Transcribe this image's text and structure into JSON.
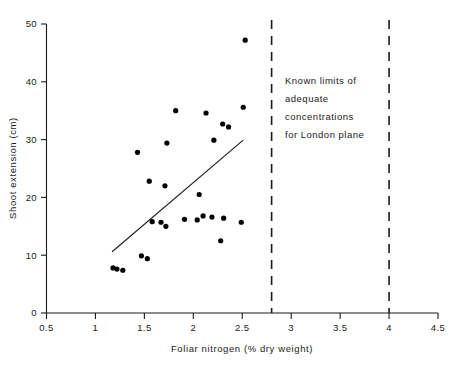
{
  "chart_data": {
    "type": "scatter",
    "title": "",
    "xlabel": "Foliar nitrogen (% dry weight)",
    "ylabel": "Shoot extension (cm)",
    "xlim": [
      0.5,
      4.5
    ],
    "ylim": [
      0,
      50
    ],
    "xticks": [
      "0.5",
      "1",
      "1.5",
      "2",
      "2.5",
      "3",
      "3.5",
      "4",
      "4.5"
    ],
    "xtick_values": [
      0.5,
      1,
      1.5,
      2,
      2.5,
      3,
      3.5,
      4,
      4.5
    ],
    "yticks": [
      "0",
      "10",
      "20",
      "30",
      "40",
      "50"
    ],
    "ytick_values": [
      0,
      10,
      20,
      30,
      40,
      50
    ],
    "grid": false,
    "legend": "none",
    "series": [
      {
        "name": "Shoot extension vs foliar nitrogen",
        "marker": "filled-circle",
        "color": "#000000",
        "points": [
          {
            "x": 1.18,
            "y": 7.8
          },
          {
            "x": 1.22,
            "y": 7.6
          },
          {
            "x": 1.28,
            "y": 7.4
          },
          {
            "x": 1.47,
            "y": 9.9
          },
          {
            "x": 1.53,
            "y": 9.4
          },
          {
            "x": 1.43,
            "y": 27.8
          },
          {
            "x": 1.55,
            "y": 22.8
          },
          {
            "x": 1.58,
            "y": 15.8
          },
          {
            "x": 1.67,
            "y": 15.7
          },
          {
            "x": 1.71,
            "y": 22.0
          },
          {
            "x": 1.72,
            "y": 15.0
          },
          {
            "x": 1.73,
            "y": 29.4
          },
          {
            "x": 1.82,
            "y": 35.0
          },
          {
            "x": 1.91,
            "y": 16.2
          },
          {
            "x": 2.04,
            "y": 16.1
          },
          {
            "x": 2.06,
            "y": 20.5
          },
          {
            "x": 2.1,
            "y": 16.8
          },
          {
            "x": 2.13,
            "y": 34.6
          },
          {
            "x": 2.19,
            "y": 16.6
          },
          {
            "x": 2.21,
            "y": 29.9
          },
          {
            "x": 2.28,
            "y": 12.5
          },
          {
            "x": 2.3,
            "y": 32.7
          },
          {
            "x": 2.31,
            "y": 16.4
          },
          {
            "x": 2.36,
            "y": 32.2
          },
          {
            "x": 2.49,
            "y": 15.7
          },
          {
            "x": 2.51,
            "y": 35.6
          },
          {
            "x": 2.53,
            "y": 47.2
          }
        ]
      }
    ],
    "trend_line": {
      "name": "regression-line",
      "x1": 1.17,
      "y1": 10.6,
      "x2": 2.51,
      "y2": 29.9
    },
    "reference_lines": [
      {
        "name": "lower-adequate-limit",
        "x": 2.8,
        "style": "dashed"
      },
      {
        "name": "upper-adequate-limit",
        "x": 4.0,
        "style": "dashed"
      }
    ],
    "annotations": [
      {
        "name": "adequate-concentration-note",
        "lines": [
          "Known limits of",
          "adequate",
          "concentrations",
          "for London plane"
        ]
      }
    ]
  }
}
